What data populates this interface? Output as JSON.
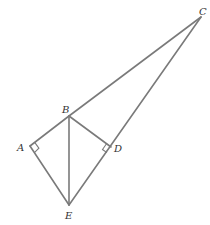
{
  "diagram": {
    "type": "geometry-figure",
    "stroke_color": "#7a7a7a",
    "label_color": "#333333",
    "points": [
      {
        "id": "A",
        "label": "A",
        "x": 30,
        "y": 146
      },
      {
        "id": "B",
        "label": "B",
        "x": 69,
        "y": 116
      },
      {
        "id": "C",
        "label": "C",
        "x": 201,
        "y": 17
      },
      {
        "id": "D",
        "label": "D",
        "x": 111,
        "y": 147
      },
      {
        "id": "E",
        "label": "E",
        "x": 69,
        "y": 205
      }
    ],
    "segments": [
      [
        "B",
        "C"
      ],
      [
        "A",
        "B"
      ],
      [
        "A",
        "E"
      ],
      [
        "B",
        "E"
      ],
      [
        "B",
        "D"
      ],
      [
        "E",
        "C"
      ]
    ],
    "right_angles": [
      {
        "vertex": "A",
        "between": [
          "B",
          "E"
        ]
      },
      {
        "vertex": "D",
        "between": [
          "B",
          "E"
        ]
      }
    ],
    "labels": {
      "A": "A",
      "B": "B",
      "C": "C",
      "D": "D",
      "E": "E"
    }
  }
}
